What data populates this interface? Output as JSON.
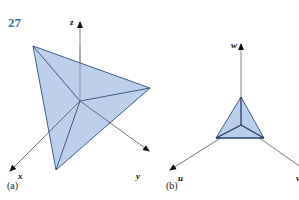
{
  "problem_number": "27",
  "panels": [
    {
      "caption": "(a)",
      "axes": {
        "vertical": "z",
        "left": "x",
        "right": "y"
      }
    },
    {
      "caption": "(b)",
      "axes": {
        "vertical": "w",
        "left": "u",
        "right": "v"
      }
    }
  ],
  "colors": {
    "fill": "#b7cbe8",
    "edge": "#2f4f7f",
    "axis": "#555555",
    "number": "#3a73b8"
  }
}
